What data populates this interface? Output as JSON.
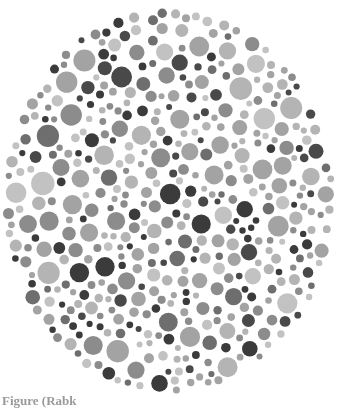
{
  "figure": {
    "type": "ishihara-style dot plate (grayscale)",
    "caption": "Figure (Rabk",
    "plate": {
      "center_x": 169,
      "center_y": 201,
      "radius_x": 167,
      "radius_y": 193,
      "background": "#ffffff",
      "palette": [
        "#3a3a3a",
        "#4a4a4a",
        "#6e6e6e",
        "#8c8c8c",
        "#a3a3a3",
        "#b4b4b4",
        "#c2c2c2"
      ],
      "palette_weights": [
        0.14,
        0.1,
        0.1,
        0.16,
        0.2,
        0.18,
        0.12
      ],
      "min_dot_radius": 3,
      "max_dot_radius": 12,
      "seed": 7
    }
  }
}
